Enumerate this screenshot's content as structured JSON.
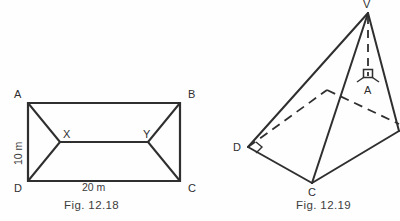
{
  "page": {
    "background_color": "#fefefe",
    "stroke_color": "#2f2f2f",
    "text_color": "#3a3a3a",
    "width": 400,
    "height": 221
  },
  "figures": [
    {
      "id": "fig-12-18",
      "caption": "Fig. 12.18",
      "type": "2d-plan-hip-roof-rectangle",
      "shape": "rectangle with central ridge",
      "vertex_labels": [
        "A",
        "B",
        "C",
        "D",
        "X",
        "Y"
      ],
      "vertices": {
        "A": {
          "label": "A",
          "x": 28,
          "y": 103
        },
        "B": {
          "label": "B",
          "x": 180,
          "y": 103
        },
        "C": {
          "label": "C",
          "x": 180,
          "y": 181
        },
        "D": {
          "label": "D",
          "x": 28,
          "y": 181
        },
        "X": {
          "label": "X",
          "x": 60,
          "y": 142
        },
        "Y": {
          "label": "Y",
          "x": 148,
          "y": 142
        }
      },
      "dimensions": {
        "height_label": "10 m",
        "width_label": "20 m"
      },
      "edges": [
        "A-B",
        "B-C",
        "C-D",
        "D-A",
        "A-X",
        "D-X",
        "B-Y",
        "C-Y",
        "X-Y"
      ]
    },
    {
      "id": "fig-12-19",
      "caption": "Fig. 12.19",
      "type": "3d-square-based-pyramid",
      "shape": "pyramid with square base",
      "vertex_labels": [
        "V",
        "A",
        "C",
        "D"
      ],
      "vertices": {
        "V": {
          "label": "V",
          "x": 368,
          "y": 13
        },
        "A": {
          "label": "A",
          "x": 368,
          "y": 85
        },
        "C": {
          "label": "C",
          "x": 312,
          "y": 183
        },
        "D": {
          "label": "D",
          "x": 248,
          "y": 147
        },
        "E": {
          "label": "",
          "x": 396,
          "y": 130
        },
        "F": {
          "label": "",
          "x": 327,
          "y": 90
        }
      },
      "solid_edges": [
        "V-D",
        "V-C",
        "V-E",
        "D-C",
        "C-E"
      ],
      "hidden_edges": [
        "D-F",
        "F-E",
        "V-A",
        "D-A-E-diagonal"
      ],
      "markers": [
        {
          "name": "right-angle-at-A",
          "at": "A",
          "note": "VA perpendicular to base"
        },
        {
          "name": "angle-mark-at-D",
          "at": "D"
        }
      ]
    }
  ]
}
